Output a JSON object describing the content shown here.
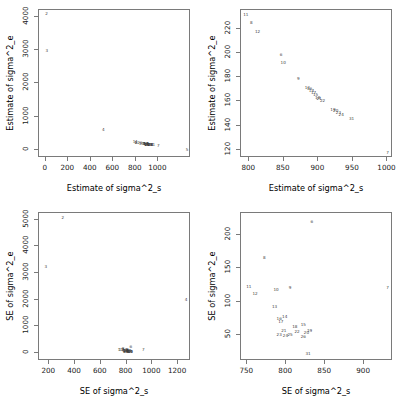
{
  "figure": {
    "type": "scatter-matrix",
    "panel_count": 4,
    "point_label_style": "numeric-index"
  },
  "chart_data": [
    {
      "type": "scatter",
      "title": "",
      "panel": "top-left",
      "xlabel": "Estimate of sigma^2_s",
      "ylabel": "Estimate of sigma^2_e",
      "xlim": [
        -60,
        1290
      ],
      "ylim": [
        -240,
        4200
      ],
      "xticks": [
        0,
        200,
        400,
        600,
        800,
        1000
      ],
      "yticks": [
        0,
        1000,
        2000,
        3000,
        4000
      ],
      "grid": false,
      "legend": "none",
      "points": [
        {
          "label": "2",
          "x": 8,
          "y": 4080
        },
        {
          "label": "3",
          "x": 10,
          "y": 2960
        },
        {
          "label": "4",
          "x": 512,
          "y": 600
        },
        {
          "label": "5",
          "x": 1255,
          "y": 10
        },
        {
          "label": "7",
          "x": 1000,
          "y": 120
        },
        {
          "label": "11",
          "x": 795,
          "y": 232
        },
        {
          "label": "8",
          "x": 803,
          "y": 225
        },
        {
          "label": "12",
          "x": 812,
          "y": 218
        },
        {
          "label": "6",
          "x": 846,
          "y": 199
        },
        {
          "label": "10",
          "x": 849,
          "y": 192
        },
        {
          "label": "9",
          "x": 871,
          "y": 179
        },
        {
          "label": "13",
          "x": 884,
          "y": 171
        },
        {
          "label": "16",
          "x": 887,
          "y": 169
        },
        {
          "label": "14",
          "x": 890,
          "y": 168
        },
        {
          "label": "17",
          "x": 893,
          "y": 166
        },
        {
          "label": "15",
          "x": 896,
          "y": 164
        },
        {
          "label": "18",
          "x": 899,
          "y": 162
        },
        {
          "label": "21",
          "x": 901,
          "y": 161
        },
        {
          "label": "22",
          "x": 906,
          "y": 159
        },
        {
          "label": "19",
          "x": 921,
          "y": 153
        },
        {
          "label": "20",
          "x": 925,
          "y": 151
        },
        {
          "label": "23",
          "x": 929,
          "y": 150
        },
        {
          "label": "24",
          "x": 932,
          "y": 149
        },
        {
          "label": "31",
          "x": 948,
          "y": 145
        }
      ]
    },
    {
      "type": "scatter",
      "title": "",
      "panel": "top-right",
      "xlabel": "Estimate of sigma^2_s",
      "ylabel": "Estimate of sigma^2_e",
      "xlim": [
        788,
        1008
      ],
      "ylim": [
        113,
        236
      ],
      "xticks": [
        800,
        850,
        900,
        950,
        1000
      ],
      "yticks": [
        120,
        140,
        160,
        180,
        200,
        220
      ],
      "grid": false,
      "legend": "none",
      "points": [
        {
          "label": "11",
          "x": 795,
          "y": 232
        },
        {
          "label": "8",
          "x": 803,
          "y": 225
        },
        {
          "label": "12",
          "x": 812,
          "y": 218
        },
        {
          "label": "6",
          "x": 846,
          "y": 199
        },
        {
          "label": "10",
          "x": 849,
          "y": 192
        },
        {
          "label": "9",
          "x": 871,
          "y": 179
        },
        {
          "label": "13",
          "x": 884,
          "y": 171
        },
        {
          "label": "16",
          "x": 887,
          "y": 170
        },
        {
          "label": "14",
          "x": 890,
          "y": 169
        },
        {
          "label": "17",
          "x": 893,
          "y": 167
        },
        {
          "label": "15",
          "x": 896,
          "y": 165
        },
        {
          "label": "18",
          "x": 899,
          "y": 163
        },
        {
          "label": "21",
          "x": 901,
          "y": 162
        },
        {
          "label": "22",
          "x": 906,
          "y": 160
        },
        {
          "label": "19",
          "x": 921,
          "y": 153
        },
        {
          "label": "20",
          "x": 925,
          "y": 152
        },
        {
          "label": "23",
          "x": 929,
          "y": 150
        },
        {
          "label": "24",
          "x": 933,
          "y": 149
        },
        {
          "label": "31",
          "x": 948,
          "y": 145
        },
        {
          "label": "7",
          "x": 1000,
          "y": 117
        }
      ]
    },
    {
      "type": "scatter",
      "title": "",
      "panel": "bottom-left",
      "xlabel": "SE of sigma^2_s",
      "ylabel": "SE of sigma^2_e",
      "xlim": [
        120,
        1300
      ],
      "ylim": [
        -300,
        5250
      ],
      "xticks": [
        200,
        400,
        600,
        800,
        1000,
        1200
      ],
      "yticks": [
        0,
        1000,
        2000,
        3000,
        4000,
        5000
      ],
      "grid": false,
      "legend": "none",
      "points": [
        {
          "label": "2",
          "x": 305,
          "y": 5050
        },
        {
          "label": "3",
          "x": 172,
          "y": 3210
        },
        {
          "label": "4",
          "x": 1262,
          "y": 2000
        },
        {
          "label": "7",
          "x": 930,
          "y": 120
        },
        {
          "label": "6",
          "x": 833,
          "y": 218
        },
        {
          "label": "8",
          "x": 772,
          "y": 165
        },
        {
          "label": "11",
          "x": 752,
          "y": 122
        },
        {
          "label": "12",
          "x": 760,
          "y": 111
        },
        {
          "label": "10",
          "x": 787,
          "y": 117
        },
        {
          "label": "9",
          "x": 805,
          "y": 120
        },
        {
          "label": "13",
          "x": 785,
          "y": 93
        },
        {
          "label": "16",
          "x": 791,
          "y": 74
        },
        {
          "label": "14",
          "x": 797,
          "y": 76
        },
        {
          "label": "17",
          "x": 793,
          "y": 70
        },
        {
          "label": "15",
          "x": 820,
          "y": 66
        },
        {
          "label": "18",
          "x": 812,
          "y": 63
        },
        {
          "label": "21",
          "x": 797,
          "y": 57
        },
        {
          "label": "22",
          "x": 815,
          "y": 55
        },
        {
          "label": "19",
          "x": 829,
          "y": 56
        },
        {
          "label": "20",
          "x": 826,
          "y": 54
        },
        {
          "label": "23",
          "x": 793,
          "y": 50
        },
        {
          "label": "24",
          "x": 800,
          "y": 49
        },
        {
          "label": "31",
          "x": 828,
          "y": 22
        }
      ]
    },
    {
      "type": "scatter",
      "title": "",
      "panel": "bottom-right",
      "xlabel": "SE of sigma^2_s",
      "ylabel": "SE of sigma^2_e",
      "xlim": [
        742,
        937
      ],
      "ylim": [
        12,
        232
      ],
      "xticks": [
        750,
        800,
        850,
        900
      ],
      "yticks": [
        50,
        100,
        150,
        200
      ],
      "grid": false,
      "legend": "none",
      "points": [
        {
          "label": "6",
          "x": 833,
          "y": 218
        },
        {
          "label": "8",
          "x": 772,
          "y": 165
        },
        {
          "label": "11",
          "x": 752,
          "y": 122
        },
        {
          "label": "12",
          "x": 760,
          "y": 111
        },
        {
          "label": "10",
          "x": 787,
          "y": 117
        },
        {
          "label": "9",
          "x": 805,
          "y": 120
        },
        {
          "label": "7",
          "x": 930,
          "y": 121
        },
        {
          "label": "13",
          "x": 785,
          "y": 93
        },
        {
          "label": "16",
          "x": 791,
          "y": 74
        },
        {
          "label": "14",
          "x": 798,
          "y": 77
        },
        {
          "label": "17",
          "x": 793,
          "y": 70
        },
        {
          "label": "15",
          "x": 822,
          "y": 66
        },
        {
          "label": "18",
          "x": 811,
          "y": 62
        },
        {
          "label": "21",
          "x": 797,
          "y": 57
        },
        {
          "label": "22",
          "x": 814,
          "y": 55
        },
        {
          "label": "19",
          "x": 830,
          "y": 56
        },
        {
          "label": "20",
          "x": 826,
          "y": 54
        },
        {
          "label": "23",
          "x": 791,
          "y": 50
        },
        {
          "label": "24",
          "x": 799,
          "y": 49
        },
        {
          "label": "25",
          "x": 805,
          "y": 50
        },
        {
          "label": "26",
          "x": 822,
          "y": 48
        },
        {
          "label": "31",
          "x": 828,
          "y": 22
        }
      ]
    }
  ]
}
